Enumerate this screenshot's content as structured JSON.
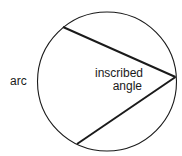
{
  "diagram": {
    "title": "Inscribed angle",
    "labels": {
      "arc": "arc",
      "angle_line1": "inscribed",
      "angle_line2": "angle"
    },
    "circle": {
      "cx": 107,
      "cy": 81.5,
      "r": 69.5
    },
    "vertex": {
      "x": 175.5,
      "y": 77
    },
    "chord_endpoints": [
      {
        "x": 63,
        "y": 27
      },
      {
        "x": 77,
        "y": 144
      }
    ],
    "colors": {
      "stroke": "#1a1a1a",
      "background": "#ffffff"
    }
  }
}
